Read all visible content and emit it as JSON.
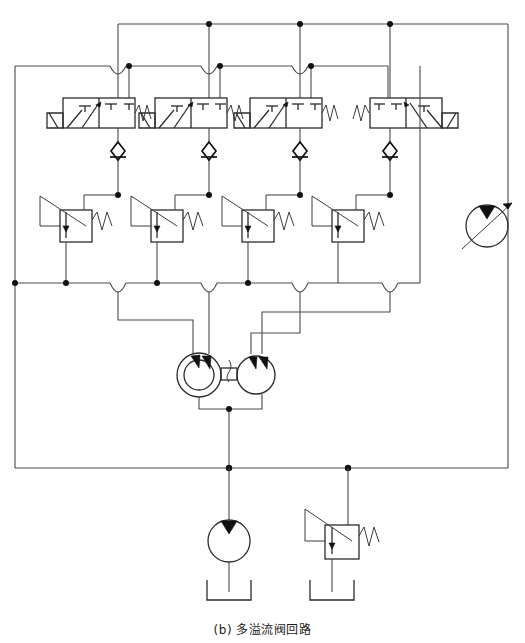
{
  "figure": {
    "caption": "(b) 多溢流阀回路",
    "caption_label": "(b)",
    "caption_title": "多溢流阀回路",
    "domain": "hydraulic-schematic",
    "width_px": 525,
    "height_px": 643
  },
  "colors": {
    "background": "#ffffff",
    "wire": "#4a4a4a",
    "symbol": "#2b2b2b",
    "junction": "#111111",
    "caption_text": "#1a1a1a"
  },
  "components": {
    "directional_valves": [
      {
        "id": "dv-1",
        "name": "directional-control-valve-1",
        "positions": 2,
        "mirrored": false,
        "x": 63,
        "y": 98
      },
      {
        "id": "dv-2",
        "name": "directional-control-valve-2",
        "positions": 2,
        "mirrored": false,
        "x": 155,
        "y": 98
      },
      {
        "id": "dv-3",
        "name": "directional-control-valve-3",
        "positions": 2,
        "mirrored": false,
        "x": 250,
        "y": 98
      },
      {
        "id": "dv-4",
        "name": "directional-control-valve-4",
        "positions": 2,
        "mirrored": true,
        "x": 370,
        "y": 98
      }
    ],
    "check_valves": [
      {
        "id": "cv-1",
        "name": "check-valve-1",
        "x": 117,
        "y": 151
      },
      {
        "id": "cv-2",
        "name": "check-valve-2",
        "x": 207,
        "y": 151
      },
      {
        "id": "cv-3",
        "name": "check-valve-3",
        "x": 299,
        "y": 151
      },
      {
        "id": "cv-4",
        "name": "check-valve-4",
        "x": 390,
        "y": 151
      }
    ],
    "relief_valves": [
      {
        "id": "rv-1",
        "name": "relief-valve-1",
        "x": 60,
        "y": 210
      },
      {
        "id": "rv-2",
        "name": "relief-valve-2",
        "x": 151,
        "y": 210
      },
      {
        "id": "rv-3",
        "name": "relief-valve-3",
        "x": 242,
        "y": 210
      },
      {
        "id": "rv-4",
        "name": "relief-valve-4",
        "x": 332,
        "y": 210
      },
      {
        "id": "rv-5",
        "name": "main-relief-valve",
        "x": 325,
        "y": 525
      }
    ],
    "pumps": [
      {
        "id": "p-1",
        "name": "double-circle-pump",
        "type": "fixed-displacement-pump",
        "cx": 199,
        "cy": 375,
        "r": 22
      },
      {
        "id": "p-2",
        "name": "twin-pump",
        "type": "fixed-displacement-pump",
        "cx": 256,
        "cy": 375,
        "r": 19
      },
      {
        "id": "p-3",
        "name": "supply-pump",
        "type": "fixed-displacement-pump",
        "cx": 229,
        "cy": 541,
        "r": 21
      },
      {
        "id": "p-4",
        "name": "variable-displacement-motor",
        "type": "variable-displacement-pump-motor",
        "cx": 487,
        "cy": 226,
        "r": 21
      }
    ],
    "tanks": [
      {
        "id": "tank-1",
        "name": "reservoir-1",
        "x": 229,
        "y": 592
      },
      {
        "id": "tank-2",
        "name": "reservoir-2",
        "x": 332,
        "y": 592
      }
    ]
  },
  "labels": {
    "valve_actuator": "spring-actuator",
    "spring_symbol": "W",
    "arrow_symbol": "▲"
  }
}
